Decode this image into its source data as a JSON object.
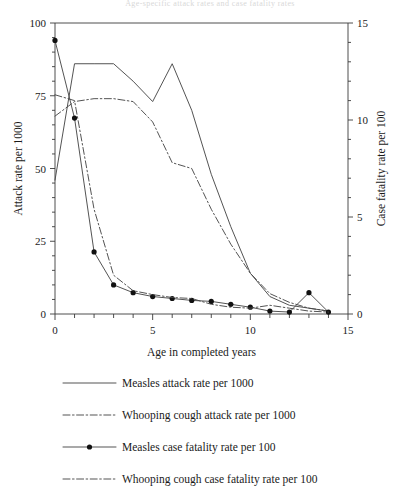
{
  "figure": {
    "top_note": "Age-specific attack rates and case fatality rates",
    "width": 400,
    "height": 504
  },
  "chart_data": {
    "type": "line",
    "title": "",
    "xlabel": "Age in completed years",
    "ylabel": "Attack rate per 1000",
    "y2label": "Case fatality rate per 100",
    "xlim": [
      0,
      15
    ],
    "ylim": [
      0,
      100
    ],
    "y2lim": [
      0,
      15
    ],
    "xticks": [
      0,
      5,
      10,
      15
    ],
    "xtick_labels": [
      "0",
      "5",
      "10",
      "15"
    ],
    "x_minor_ticks": [
      1,
      2,
      3,
      4,
      6,
      7,
      8,
      9,
      11,
      12,
      13,
      14
    ],
    "yticks": [
      0,
      25,
      50,
      75,
      100
    ],
    "ytick_labels": [
      "0",
      "25",
      "50",
      "75",
      "100"
    ],
    "y2ticks": [
      0,
      5,
      10,
      15
    ],
    "y2tick_labels": [
      "0",
      "5",
      "10",
      "15"
    ],
    "y2_minor_ticks": [
      1,
      2,
      3,
      4,
      6,
      7,
      8,
      9,
      11,
      12,
      13,
      14
    ],
    "grid": false,
    "legend_position": "below",
    "x": [
      0,
      1,
      2,
      3,
      4,
      5,
      6,
      7,
      8,
      9,
      10,
      11,
      12,
      13,
      14
    ],
    "series": [
      {
        "name": "Measles attack rate per 1000",
        "axis": "left",
        "style": "solid",
        "markers": false,
        "values": [
          46,
          86,
          86,
          86,
          80,
          73,
          86,
          70,
          48,
          30,
          14,
          6,
          3,
          2,
          1
        ]
      },
      {
        "name": "Whooping cough attack rate per 1000",
        "axis": "left",
        "style": "dashdot",
        "markers": false,
        "values": [
          68,
          73,
          74,
          74,
          73,
          66,
          52,
          50,
          36,
          24,
          14,
          7,
          4,
          2,
          1
        ]
      },
      {
        "name": "Measles case fatality rate per 100",
        "axis": "right",
        "style": "solid",
        "markers": true,
        "values": [
          14.1,
          10.1,
          3.2,
          1.5,
          1.1,
          0.9,
          0.8,
          0.7,
          0.65,
          0.5,
          0.35,
          0.15,
          0.1,
          1.1,
          0.1
        ]
      },
      {
        "name": "Whooping cough case fatality rate per 100",
        "axis": "right",
        "style": "dashdot",
        "markers": false,
        "values": [
          11.3,
          11.0,
          5.4,
          2.0,
          1.2,
          1.0,
          0.85,
          0.8,
          0.5,
          0.35,
          0.3,
          0.45,
          0.3,
          0.15,
          0.1
        ]
      }
    ]
  },
  "legend": {
    "items": [
      {
        "label": "Measles attack rate per 1000",
        "style": "solid",
        "marker": false
      },
      {
        "label": "Whooping cough attack rate per 1000",
        "style": "dashdot",
        "marker": false
      },
      {
        "label": "Measles case fatality rate per 100",
        "style": "solid",
        "marker": true
      },
      {
        "label": "Whooping cough case fatality rate per 100",
        "style": "dashdot",
        "marker": false
      }
    ]
  },
  "colors": {
    "line": "#4a4a4a",
    "marker": "#111111",
    "axis": "#3a3a3a",
    "text": "#1a1a1a",
    "background": "#ffffff"
  }
}
